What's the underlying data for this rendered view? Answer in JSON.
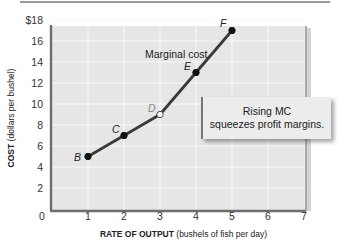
{
  "chart_data": {
    "type": "line",
    "title": "",
    "xlabel_bold": "RATE OF OUTPUT",
    "xlabel_rest": "(bushels of fish per day)",
    "ylabel_bold": "COST",
    "ylabel_rest": "(dollars per bushel)",
    "xlim": [
      0,
      7
    ],
    "ylim": [
      0,
      18
    ],
    "x_ticks": [
      "0",
      "1",
      "2",
      "3",
      "4",
      "5",
      "6",
      "7"
    ],
    "y_ticks": [
      "2",
      "4",
      "6",
      "8",
      "10",
      "12",
      "14",
      "16",
      "$18"
    ],
    "grid": true,
    "series": [
      {
        "name": "Marginal cost",
        "points": [
          {
            "label": "B",
            "x": 1,
            "y": 5,
            "marker": "filled"
          },
          {
            "label": "C",
            "x": 2,
            "y": 7,
            "marker": "filled"
          },
          {
            "label": "D",
            "x": 3,
            "y": 9,
            "marker": "hollow"
          },
          {
            "label": "E",
            "x": 4,
            "y": 13,
            "marker": "filled"
          },
          {
            "label": "F",
            "x": 5,
            "y": 17,
            "marker": "filled"
          }
        ]
      }
    ],
    "annotations": {
      "curve_label": "Marginal cost",
      "callout_line1": "Rising MC",
      "callout_line2": "squeezes profit margins."
    }
  },
  "colors": {
    "plot_bg": "#e6e6e6",
    "grid": "#f7f7f7",
    "axis": "#6e6e6e",
    "line": "#3a3a3a"
  }
}
